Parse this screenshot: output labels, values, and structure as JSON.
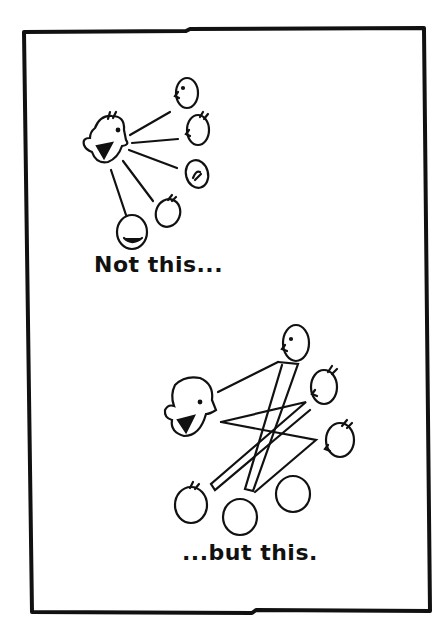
{
  "panels": [
    {
      "id": "top",
      "caption": "Not this...",
      "description": "One speaker talking to five listeners, one-way lines"
    },
    {
      "id": "bottom",
      "caption": "...but this.",
      "description": "Group of six people with crisscrossing lines of communication"
    }
  ],
  "colors": {
    "ink": "#111111",
    "paper": "#ffffff"
  }
}
